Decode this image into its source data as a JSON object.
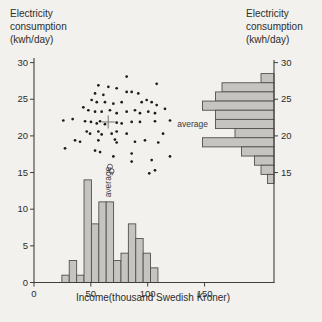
{
  "titles": {
    "left_lines": [
      "Electricity",
      "consumption",
      "(kwh/day)"
    ],
    "right_lines": [
      "Electricity",
      "consumption",
      "(kwh/day)"
    ],
    "bottom": "Income(thousand Swedish Kroner)"
  },
  "annotations": {
    "scatter_average_label": "average",
    "right_average_label": "average"
  },
  "colors": {
    "paper": "#f2f1ed",
    "bar_fill": "#c5c4c1",
    "bar_stroke": "#52514d",
    "axis": "#3f3e3a",
    "dot": "#1b1b19",
    "mean_cross": "#8f8f8c",
    "text": "#2d2d2b"
  },
  "chart_data": {
    "type": "scatter",
    "xlabel": "Income(thousand Swedish Kroner)",
    "ylabel": "Electricity consumption (kwh/day)",
    "x_axis": {
      "ticks": [
        0,
        50,
        100,
        150
      ],
      "range": [
        0,
        211
      ]
    },
    "y_axis": {
      "ticks_left": [
        30,
        25,
        20,
        15,
        10,
        5,
        0
      ],
      "ticks_right": [
        30,
        25,
        20,
        15
      ],
      "range": [
        0,
        30
      ]
    },
    "scatter": {
      "points": [
        [
          81.5,
          28.1
        ],
        [
          107.9,
          27.1
        ],
        [
          56.6,
          26.9
        ],
        [
          65.4,
          26.7
        ],
        [
          72.7,
          26.5
        ],
        [
          81.5,
          26.0
        ],
        [
          85.9,
          26.0
        ],
        [
          53.7,
          25.8
        ],
        [
          91.7,
          25.8
        ],
        [
          61.0,
          25.6
        ],
        [
          50.7,
          24.9
        ],
        [
          99.1,
          24.9
        ],
        [
          55.2,
          24.6
        ],
        [
          62.4,
          24.6
        ],
        [
          77.1,
          24.6
        ],
        [
          94.7,
          24.6
        ],
        [
          103.5,
          24.6
        ],
        [
          69.8,
          24.4
        ],
        [
          107.9,
          24.2
        ],
        [
          43.4,
          23.9
        ],
        [
          115.2,
          23.7
        ],
        [
          47.8,
          23.5
        ],
        [
          66.8,
          23.5
        ],
        [
          88.8,
          23.5
        ],
        [
          53.7,
          23.3
        ],
        [
          59.5,
          23.3
        ],
        [
          81.5,
          23.3
        ],
        [
          100.5,
          23.3
        ],
        [
          72.7,
          23.1
        ],
        [
          93.2,
          23.1
        ],
        [
          106.4,
          23.1
        ],
        [
          34.0,
          22.3
        ],
        [
          25.8,
          22.1
        ],
        [
          119.6,
          22.1
        ],
        [
          44.9,
          22.0
        ],
        [
          58.1,
          22.0
        ],
        [
          106.4,
          22.0
        ],
        [
          50.1,
          21.9
        ],
        [
          85.9,
          21.9
        ],
        [
          93.2,
          21.9
        ],
        [
          55.2,
          21.7
        ],
        [
          77.1,
          21.7
        ],
        [
          62.4,
          21.6
        ],
        [
          72.7,
          21.8
        ],
        [
          46.4,
          20.6
        ],
        [
          56.6,
          20.6
        ],
        [
          72.7,
          20.6
        ],
        [
          49.3,
          20.3
        ],
        [
          68.3,
          20.3
        ],
        [
          81.5,
          20.3
        ],
        [
          113.5,
          20.3
        ],
        [
          59.5,
          20.2
        ],
        [
          36.1,
          19.4
        ],
        [
          56.6,
          19.4
        ],
        [
          97.6,
          19.4
        ],
        [
          71.2,
          19.5
        ],
        [
          40.5,
          19.2
        ],
        [
          88.8,
          19.2
        ],
        [
          72.7,
          19.1
        ],
        [
          109.3,
          19.1
        ],
        [
          27.3,
          18.3
        ],
        [
          53.7,
          18.0
        ],
        [
          58.1,
          17.8
        ],
        [
          85.9,
          17.6
        ],
        [
          69.8,
          17.2
        ],
        [
          119.6,
          17.2
        ],
        [
          103.5,
          16.7
        ],
        [
          85.9,
          16.5
        ],
        [
          106.4,
          15.3
        ],
        [
          101.4,
          14.9
        ]
      ],
      "open_circle_points": [
        [
          66.8,
          15.8
        ],
        [
          68.2,
          15.2
        ]
      ],
      "mean_marker": {
        "income": 65.3,
        "kwh": 21.9
      }
    },
    "income_histogram": {
      "orientation": "vertical",
      "bin_start": 24.5,
      "bin_width": 6.5,
      "frequencies": [
        1,
        3,
        1,
        14,
        8,
        11,
        11,
        3,
        4,
        8,
        6,
        4,
        2
      ]
    },
    "consumption_histogram": {
      "orientation": "horizontal-left",
      "bin_top": 28.5,
      "bin_width": 1.25,
      "frequencies_top_to_bottom": [
        2,
        8,
        9,
        11,
        9,
        9,
        6,
        11,
        5,
        3,
        2,
        1
      ]
    },
    "layout": {
      "x0_px": 34,
      "base_y_px": 282.5,
      "px_per_x": 1.137,
      "px_per_y": 7.33,
      "right_axis_x_px": 274,
      "axis_top_y_px": 58,
      "tick_len": 4,
      "dot_r": 1.35,
      "open_circle_r": 2.5,
      "cross_half": 6.5,
      "right_px_per_count": 6.5,
      "scatter_avg_label_px": {
        "x": 111,
        "y": 182
      },
      "right_avg_label_px": {
        "x": 208,
        "y": 124.5
      },
      "bottom_label_px": {
        "x": 153,
        "y": 301
      }
    }
  }
}
